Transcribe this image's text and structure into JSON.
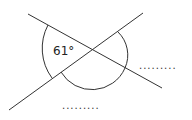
{
  "diagram": {
    "type": "intersecting-lines-angles",
    "given_angle_label": "61°",
    "answer_blanks": [
      {
        "id": "right",
        "text": "........."
      },
      {
        "id": "bottom",
        "text": "........."
      }
    ],
    "colors": {
      "line": "#333333",
      "text": "#222222",
      "background": "#ffffff"
    }
  }
}
